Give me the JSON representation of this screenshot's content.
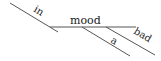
{
  "diagram": {
    "type": "reed-kellogg-sentence-diagram",
    "phrase": "in a bad mood",
    "preposition": "in",
    "object": "mood",
    "modifiers": [
      "a",
      "bad"
    ],
    "line_color": "#555555",
    "text_color": "#1a1a1a"
  },
  "labels": {
    "preposition": "in",
    "object": "mood",
    "modifier_1": "a",
    "modifier_2": "bad"
  }
}
